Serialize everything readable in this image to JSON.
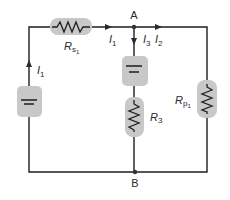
{
  "diagram": {
    "type": "circuit-schematic",
    "colors": {
      "wire": "#1e1e1e",
      "component_highlight": "#c8c8c8",
      "arrow": "#2a2a2a",
      "node": "#333333"
    },
    "nodes": {
      "A": {
        "label": "A"
      },
      "B": {
        "label": "B"
      }
    },
    "components": {
      "rs1": {
        "kind": "resistor",
        "label": "R",
        "sub": "s",
        "subsub": "1"
      },
      "rp1": {
        "kind": "resistor",
        "label": "R",
        "sub": "p",
        "subsub": "1"
      },
      "r3": {
        "kind": "resistor",
        "label": "R",
        "sub": "3"
      },
      "left_source": {
        "kind": "battery"
      },
      "middle_source": {
        "kind": "battery"
      }
    },
    "currents": {
      "left": {
        "label": "I",
        "sub": "1"
      },
      "top": {
        "label": "I",
        "sub": "1"
      },
      "i3": {
        "label": "I",
        "sub": "3"
      },
      "i2": {
        "label": "I",
        "sub": "2"
      }
    }
  }
}
